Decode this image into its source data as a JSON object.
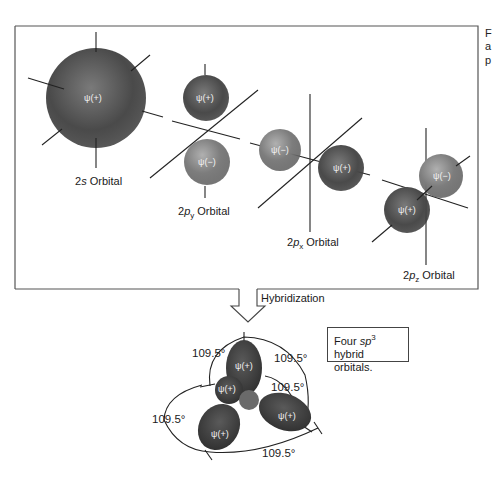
{
  "figure": {
    "orbitals": [
      {
        "name": "2s Orbital",
        "label_main": "2",
        "label_italic": "s",
        "label_sub": "",
        "label_rest": " Orbital",
        "lobes": [
          "ψ(+)"
        ]
      },
      {
        "name": "2py Orbital",
        "label_main": "2",
        "label_italic": "p",
        "label_sub": "y",
        "label_rest": " Orbital",
        "lobes": [
          "ψ(+)",
          "ψ(−)"
        ]
      },
      {
        "name": "2px Orbital",
        "label_main": "2",
        "label_italic": "p",
        "label_sub": "x",
        "label_rest": " Orbital",
        "lobes": [
          "ψ(−)",
          "ψ(+)"
        ]
      },
      {
        "name": "2pz Orbital",
        "label_main": "2",
        "label_italic": "p",
        "label_sub": "z",
        "label_rest": " Orbital",
        "lobes": [
          "ψ(−)",
          "ψ(+)"
        ]
      }
    ],
    "process_label": "Hybridization",
    "hybrid": {
      "lobes": [
        "ψ(+)",
        "ψ(+)",
        "ψ(+)",
        "ψ(+)"
      ],
      "angles": [
        "109.5°",
        "109.5°",
        "109.5°",
        "109.5°",
        "109.5°"
      ],
      "callout_pre": "Four ",
      "callout_italic": "sp",
      "callout_sup": "3",
      "callout_post": " hybrid orbitals."
    },
    "side_caption_fragments": [
      "F",
      "a",
      "p"
    ]
  }
}
